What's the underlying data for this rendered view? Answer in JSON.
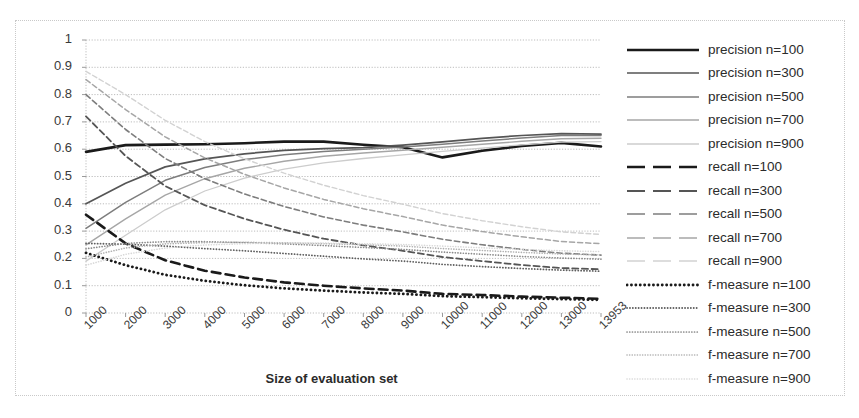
{
  "chart_data": {
    "type": "line",
    "title": "",
    "subtitle": "",
    "xlabel": "Size of evaluation set",
    "ylabel": "",
    "grid": true,
    "legend_position": "right",
    "xlim": [
      0,
      13
    ],
    "ylim": [
      0,
      1
    ],
    "yticks": [
      "1",
      "0.9",
      "0.8",
      "0.7",
      "0.6",
      "0.5",
      "0.4",
      "0.3",
      "0.2",
      "0.1",
      "0"
    ],
    "ytick_values": [
      1,
      0.9,
      0.8,
      0.7,
      0.6,
      0.5,
      0.4,
      0.3,
      0.2,
      0.1,
      0
    ],
    "categories": [
      "1000",
      "2000",
      "3000",
      "4000",
      "5000",
      "6000",
      "7000",
      "8000",
      "9000",
      "10000",
      "11000",
      "12000",
      "13000",
      "13953"
    ],
    "series": [
      {
        "name": "precision n=100",
        "style": "solid",
        "shade": "#1a1a1a",
        "width": 2.6,
        "values": [
          0.59,
          0.615,
          0.617,
          0.618,
          0.622,
          0.628,
          0.628,
          0.616,
          0.607,
          0.57,
          0.594,
          0.612,
          0.623,
          0.61
        ]
      },
      {
        "name": "precision n=300",
        "style": "solid",
        "shade": "#555555",
        "width": 1.7,
        "values": [
          0.4,
          0.475,
          0.535,
          0.565,
          0.583,
          0.596,
          0.602,
          0.606,
          0.615,
          0.627,
          0.64,
          0.65,
          0.657,
          0.655
        ]
      },
      {
        "name": "precision n=500",
        "style": "solid",
        "shade": "#7d7d7d",
        "width": 1.5,
        "values": [
          0.31,
          0.405,
          0.486,
          0.533,
          0.562,
          0.58,
          0.592,
          0.6,
          0.608,
          0.618,
          0.63,
          0.641,
          0.65,
          0.65
        ]
      },
      {
        "name": "precision n=700",
        "style": "solid",
        "shade": "#a6a6a6",
        "width": 1.4,
        "values": [
          0.25,
          0.345,
          0.432,
          0.492,
          0.53,
          0.556,
          0.574,
          0.586,
          0.596,
          0.607,
          0.618,
          0.629,
          0.638,
          0.64
        ]
      },
      {
        "name": "precision n=900",
        "style": "solid",
        "shade": "#cccccc",
        "width": 1.3,
        "values": [
          0.19,
          0.285,
          0.378,
          0.447,
          0.494,
          0.527,
          0.55,
          0.566,
          0.579,
          0.592,
          0.604,
          0.616,
          0.626,
          0.628
        ]
      },
      {
        "name": "recall n=100",
        "style": "dashed",
        "shade": "#1a1a1a",
        "width": 2.6,
        "values": [
          0.36,
          0.255,
          0.193,
          0.155,
          0.13,
          0.112,
          0.1,
          0.09,
          0.082,
          0.07,
          0.066,
          0.06,
          0.056,
          0.052
        ]
      },
      {
        "name": "recall n=300",
        "style": "dashed",
        "shade": "#555555",
        "width": 1.8,
        "values": [
          0.72,
          0.575,
          0.465,
          0.395,
          0.345,
          0.305,
          0.272,
          0.248,
          0.228,
          0.205,
          0.19,
          0.176,
          0.165,
          0.16
        ]
      },
      {
        "name": "recall n=500",
        "style": "dashed",
        "shade": "#7d7d7d",
        "width": 1.6,
        "values": [
          0.8,
          0.672,
          0.566,
          0.492,
          0.436,
          0.39,
          0.352,
          0.322,
          0.297,
          0.27,
          0.25,
          0.233,
          0.219,
          0.212
        ]
      },
      {
        "name": "recall n=700",
        "style": "dashed",
        "shade": "#a6a6a6",
        "width": 1.5,
        "values": [
          0.855,
          0.745,
          0.645,
          0.568,
          0.508,
          0.458,
          0.416,
          0.382,
          0.353,
          0.322,
          0.298,
          0.279,
          0.262,
          0.254
        ]
      },
      {
        "name": "recall n=900",
        "style": "dashed",
        "shade": "#d2d2d2",
        "width": 1.4,
        "values": [
          0.885,
          0.8,
          0.706,
          0.628,
          0.565,
          0.512,
          0.468,
          0.43,
          0.398,
          0.364,
          0.338,
          0.316,
          0.297,
          0.288
        ]
      },
      {
        "name": "f-measure n=100",
        "style": "dotted",
        "shade": "#1a1a1a",
        "width": 2.8,
        "values": [
          0.22,
          0.175,
          0.14,
          0.118,
          0.102,
          0.09,
          0.082,
          0.075,
          0.07,
          0.062,
          0.058,
          0.054,
          0.051,
          0.048
        ]
      },
      {
        "name": "f-measure n=300",
        "style": "dotted",
        "shade": "#5f5f5f",
        "width": 1.8,
        "values": [
          0.255,
          0.252,
          0.245,
          0.236,
          0.228,
          0.218,
          0.208,
          0.198,
          0.19,
          0.178,
          0.17,
          0.163,
          0.157,
          0.153
        ]
      },
      {
        "name": "f-measure n=500",
        "style": "dotted",
        "shade": "#8a8a8a",
        "width": 1.7,
        "values": [
          0.235,
          0.255,
          0.261,
          0.261,
          0.258,
          0.253,
          0.247,
          0.24,
          0.233,
          0.223,
          0.215,
          0.207,
          0.201,
          0.197
        ]
      },
      {
        "name": "f-measure n=700",
        "style": "dotted",
        "shade": "#b0b0b0",
        "width": 1.6,
        "values": [
          0.205,
          0.238,
          0.253,
          0.258,
          0.259,
          0.257,
          0.254,
          0.25,
          0.245,
          0.236,
          0.229,
          0.222,
          0.216,
          0.213
        ]
      },
      {
        "name": "f-measure n=900",
        "style": "dotted",
        "shade": "#d8d8d8",
        "width": 1.6,
        "values": [
          0.175,
          0.215,
          0.238,
          0.249,
          0.254,
          0.256,
          0.256,
          0.254,
          0.251,
          0.245,
          0.239,
          0.233,
          0.228,
          0.225
        ]
      }
    ]
  },
  "axis": {
    "x_title": "Size of evaluation set"
  },
  "legend": {
    "items": [
      {
        "label": "precision n=100"
      },
      {
        "label": "precision n=300"
      },
      {
        "label": "precision n=500"
      },
      {
        "label": "precision n=700"
      },
      {
        "label": "precision n=900"
      },
      {
        "label": "recall n=100"
      },
      {
        "label": "recall n=300"
      },
      {
        "label": "recall n=500"
      },
      {
        "label": "recall n=700"
      },
      {
        "label": "recall n=900"
      },
      {
        "label": "f-measure n=100"
      },
      {
        "label": "f-measure n=300"
      },
      {
        "label": "f-measure n=500"
      },
      {
        "label": "f-measure n=700"
      },
      {
        "label": "f-measure n=900"
      }
    ]
  },
  "colors": {
    "gridline": "#bdbdbd",
    "frame": "#c9c9c9",
    "text": "#2b2b2b",
    "background": "#ffffff"
  }
}
